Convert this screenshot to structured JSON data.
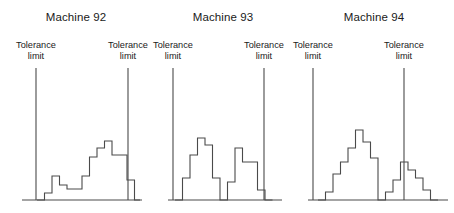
{
  "figure": {
    "background_color": "#ffffff",
    "line_color": "#4a4a4a",
    "text_color": "#1a1a1a",
    "width": 454,
    "height": 213
  },
  "labels": {
    "tolerance_line1": "Tolerance",
    "tolerance_line2": "limit"
  },
  "chart_data": {
    "type": "bar",
    "title": "",
    "xlabel": "",
    "ylabel": "",
    "grid": false,
    "legend": "none",
    "bin_width": 7.5,
    "baseline_y": 200,
    "max_height": 72,
    "panels": [
      {
        "name": "machine-92",
        "title": "Machine 92",
        "panel_left": 0,
        "panel_width": 152,
        "title_center_x": 82,
        "axis_x_start": 22,
        "axis_x_end": 140,
        "tolerance_lower": {
          "x": 36,
          "label_center_x": 36,
          "top_y": 68
        },
        "tolerance_upper": {
          "x": 128,
          "label_center_x": 128,
          "top_y": 68
        },
        "bin_start_x": 37,
        "bins": [
          0,
          7,
          24,
          15,
          11,
          11,
          24,
          43,
          52,
          59,
          45,
          45,
          20,
          0
        ],
        "values_note": "bar heights in pixels above baseline"
      },
      {
        "name": "machine-93",
        "title": "Machine 93",
        "panel_left": 152,
        "panel_width": 142,
        "title_center_x": 219,
        "axis_x_start": 168,
        "axis_x_end": 282,
        "tolerance_lower": {
          "x": 173,
          "label_center_x": 173,
          "top_y": 68
        },
        "tolerance_upper": {
          "x": 264,
          "label_center_x": 264,
          "top_y": 68
        },
        "bin_start_x": 175,
        "bins": [
          0,
          22,
          45,
          62,
          55,
          22,
          0,
          18,
          52,
          38,
          38,
          10,
          0
        ],
        "values_note": "bar heights in pixels above baseline"
      },
      {
        "name": "machine-94",
        "title": "Machine 94",
        "panel_left": 294,
        "panel_width": 160,
        "title_center_x": 368,
        "axis_x_start": 308,
        "axis_x_end": 448,
        "tolerance_lower": {
          "x": 313,
          "label_center_x": 313,
          "top_y": 68
        },
        "tolerance_upper": {
          "x": 404,
          "label_center_x": 404,
          "top_y": 68
        },
        "bin_start_x": 318,
        "bins": [
          0,
          8,
          26,
          38,
          52,
          70,
          58,
          42,
          0,
          8,
          20,
          38,
          30,
          22,
          10,
          0
        ],
        "values_note": "bar heights in pixels above baseline"
      }
    ]
  }
}
